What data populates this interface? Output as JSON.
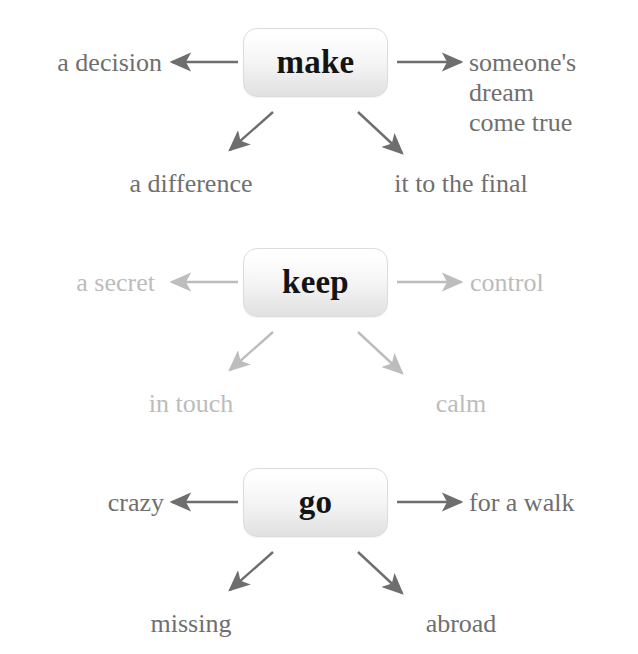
{
  "diagram": {
    "type": "collocation-mind-map",
    "title": "",
    "background_color": "#ffffff",
    "clusters": [
      {
        "id": "make",
        "verb": "make",
        "tone": "dark",
        "text_color": "#6f6f6f",
        "verb_color": "#141414",
        "arrow_color": "#6e6e6e",
        "collocations": {
          "left": "a decision",
          "right": "someone's\ndream\ncome true",
          "down_left": "a difference",
          "down_right": "it to the final"
        }
      },
      {
        "id": "keep",
        "verb": "keep",
        "tone": "light",
        "text_color": "#bcbcbc",
        "verb_color": "#141414",
        "arrow_color": "#bdbdbd",
        "collocations": {
          "left": "a secret",
          "right": "control",
          "down_left": "in touch",
          "down_right": "calm"
        }
      },
      {
        "id": "go",
        "verb": "go",
        "tone": "dark",
        "text_color": "#6f6f6f",
        "verb_color": "#141414",
        "arrow_color": "#6e6e6e",
        "collocations": {
          "left": "crazy",
          "right": "for a walk",
          "down_left": "missing",
          "down_right": "abroad"
        }
      }
    ],
    "icons": {
      "arrow_left": "arrow-left-icon",
      "arrow_right": "arrow-right-icon",
      "arrow_down_left": "arrow-down-left-icon",
      "arrow_down_right": "arrow-down-right-icon"
    }
  }
}
